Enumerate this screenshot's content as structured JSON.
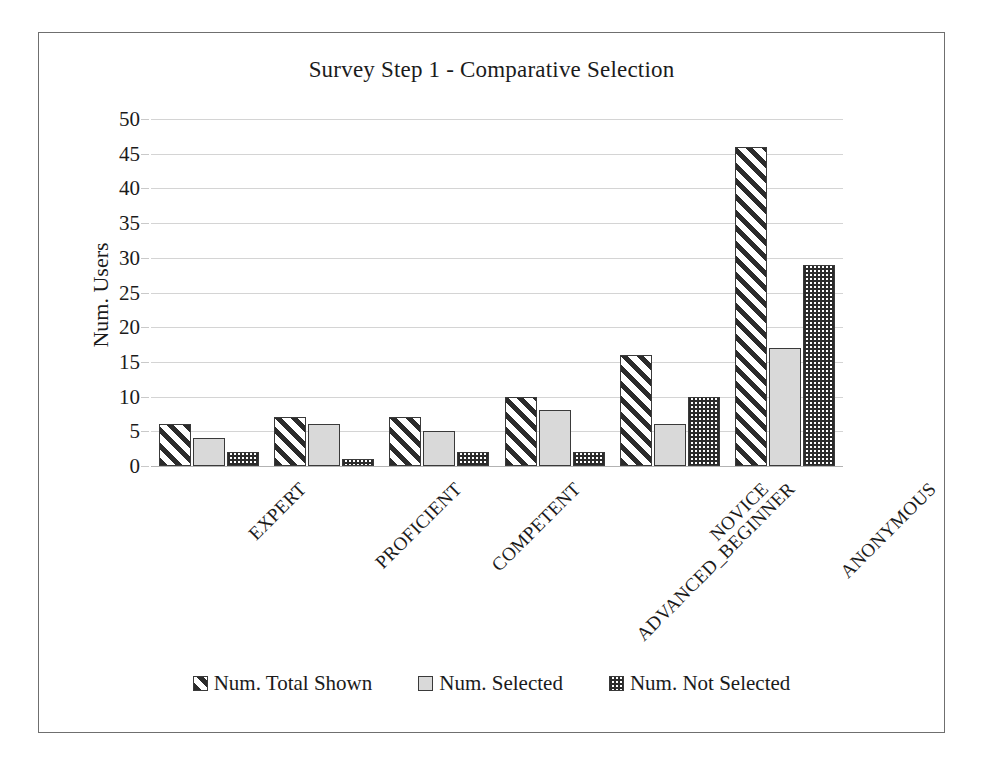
{
  "chart_data": {
    "type": "bar",
    "title": "Survey Step 1 - Comparative Selection",
    "xlabel": "",
    "ylabel": "Num. Users",
    "ylim": [
      0,
      50
    ],
    "ytick_step": 5,
    "yticks": [
      "50",
      "45",
      "40",
      "35",
      "30",
      "25",
      "20",
      "15",
      "10",
      "5",
      "0"
    ],
    "grid": true,
    "legend_position": "bottom",
    "categories": [
      "EXPERT",
      "PROFICIENT",
      "COMPETENT",
      "ADVANCED_BEGINNER",
      "NOVICE",
      "ANONYMOUS"
    ],
    "series": [
      {
        "name": "Num. Total Shown",
        "pattern": "diagonal-stripes",
        "values": [
          6,
          7,
          7,
          10,
          16,
          46
        ]
      },
      {
        "name": "Num. Selected",
        "pattern": "light-gray-solid",
        "values": [
          4,
          6,
          5,
          8,
          6,
          17
        ]
      },
      {
        "name": "Num. Not Selected",
        "pattern": "checker",
        "values": [
          2,
          1,
          2,
          2,
          10,
          29
        ]
      }
    ]
  },
  "colors": {
    "gridline": "#d4d4d4",
    "axis": "#b3b3b3",
    "bar_outline": "#3a3a3a",
    "bar_solid_fill": "#d9d9d9",
    "pattern_ink": "#2b2b2b",
    "frame_border": "#6f6f6f",
    "text": "#1b1b1b"
  },
  "caption": ""
}
